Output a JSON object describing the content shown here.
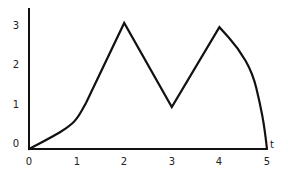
{
  "chart_data": {
    "type": "line",
    "title": "",
    "xlabel": "t",
    "ylabel": "",
    "xlim": [
      0,
      5
    ],
    "ylim": [
      0,
      3.3
    ],
    "grid": false,
    "legend": null,
    "x_ticks": [
      "0",
      "1",
      "2",
      "3",
      "4",
      "5"
    ],
    "y_ticks": [
      "0",
      "1",
      "2",
      "3"
    ],
    "series": [
      {
        "name": "f(t)",
        "color": "#111111",
        "points": [
          {
            "t": 0.0,
            "y": 0.0
          },
          {
            "t": 0.5,
            "y": 0.3
          },
          {
            "t": 0.8,
            "y": 0.5
          },
          {
            "t": 1.0,
            "y": 0.7
          },
          {
            "t": 1.2,
            "y": 1.1
          },
          {
            "t": 2.0,
            "y": 3.0
          },
          {
            "t": 3.0,
            "y": 1.0
          },
          {
            "t": 4.0,
            "y": 2.9
          },
          {
            "t": 4.4,
            "y": 2.4
          },
          {
            "t": 4.7,
            "y": 1.8
          },
          {
            "t": 4.85,
            "y": 1.1
          },
          {
            "t": 4.95,
            "y": 0.5
          },
          {
            "t": 5.0,
            "y": 0.0
          }
        ]
      }
    ]
  }
}
